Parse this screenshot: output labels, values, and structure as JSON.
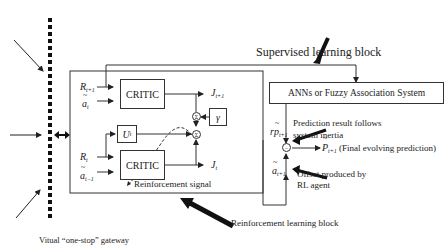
{
  "diagram": {
    "gateway": {
      "label": "Vitual “one-stop” gateway"
    },
    "rl_block": {
      "label": "Reinforcement learning block",
      "critic_top": {
        "label": "CRITIC",
        "inputs": [
          "R",
          "t+1",
          "a",
          "t"
        ],
        "output": {
          "sym": "J",
          "sub": "t+1"
        }
      },
      "critic_bottom": {
        "label": "CRITIC",
        "inputs": [
          "R",
          "t",
          "a",
          "t−1"
        ],
        "output": {
          "sym": "J",
          "sub": "t"
        }
      },
      "utility": {
        "sym": "U",
        "sub": "t"
      },
      "gamma": "γ",
      "sum_node_1": "Σ",
      "sum_node_2": "Σ",
      "reinforcement_signal": "Reinforcement signal"
    },
    "sl_block": {
      "label": "Supervised learning block",
      "system": "ANNs or Fuzzy Association System",
      "rp": {
        "sym": "rp",
        "sub": "t+1"
      },
      "a": {
        "sym": "a",
        "sub": "t+1"
      },
      "minus_node": "−",
      "output": {
        "sym": "P",
        "sub": "t+1",
        "desc": "(Final evolving prediction)"
      },
      "note_prediction_line1": "Prediction result follows",
      "note_prediction_line2": "system inertia",
      "note_offset_line1": "Offset produced by",
      "note_offset_line2": "RL agent"
    }
  }
}
